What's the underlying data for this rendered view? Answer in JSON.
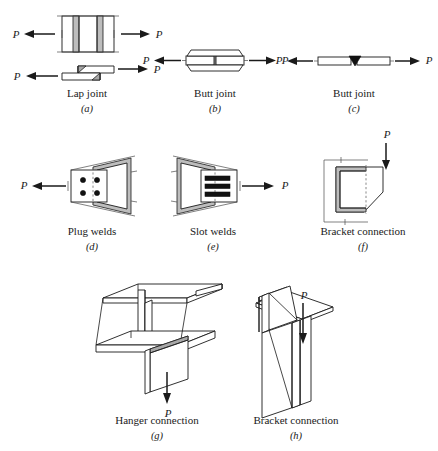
{
  "figure": {
    "background": "#ffffff",
    "ink": "#1a1a1a",
    "weld_fill": "#bdbdbd",
    "hidden_line": "#7a7a7a"
  },
  "load_label": "P",
  "panels": [
    {
      "key": "a",
      "caption": "Lap joint",
      "subcaption": "(a)",
      "views": [
        "plan",
        "elevation"
      ],
      "load_labels": [
        "P",
        "P",
        "P",
        "P"
      ],
      "weld_count": 2,
      "weld_type": "fillet"
    },
    {
      "key": "b",
      "caption": "Butt joint",
      "subcaption": "(b)",
      "views": [
        "elevation"
      ],
      "load_labels": [
        "P",
        "P"
      ],
      "weld_count": 2,
      "weld_type": "splice-plate"
    },
    {
      "key": "c",
      "caption": "Butt joint",
      "subcaption": "(c)",
      "views": [
        "elevation"
      ],
      "load_labels": [
        "P",
        "P"
      ],
      "weld_count": 1,
      "weld_type": "v-groove"
    },
    {
      "key": "d",
      "caption": "Plug welds",
      "subcaption": "(d)",
      "views": [
        "plan"
      ],
      "load_labels": [
        "P"
      ],
      "weld_count": 4,
      "weld_type": "plug"
    },
    {
      "key": "e",
      "caption": "Slot welds",
      "subcaption": "(e)",
      "views": [
        "plan"
      ],
      "load_labels": [
        "P"
      ],
      "weld_count": 3,
      "weld_type": "slot"
    },
    {
      "key": "f",
      "caption": "Bracket connection",
      "subcaption": "(f)",
      "views": [
        "elevation"
      ],
      "load_labels": [
        "P"
      ],
      "weld_count": 1,
      "weld_type": "c-shaped-fillet"
    },
    {
      "key": "g",
      "caption": "Hanger connection",
      "subcaption": "(g)",
      "views": [
        "isometric"
      ],
      "load_labels": [
        "P"
      ],
      "weld_count": 1,
      "weld_type": "fillet"
    },
    {
      "key": "h",
      "caption": "Bracket connection",
      "subcaption": "(h)",
      "views": [
        "isometric"
      ],
      "load_labels": [
        "P"
      ],
      "weld_count": 1,
      "weld_type": "fillet"
    }
  ]
}
